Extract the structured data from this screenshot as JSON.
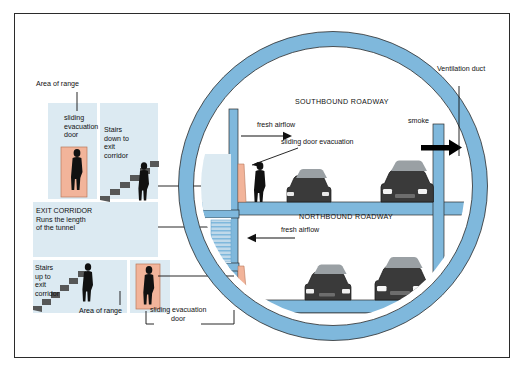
{
  "diagram": {
    "colors": {
      "ring_blue": "#7FB8DC",
      "ring_blue_dark": "#5E9FC8",
      "tile_pale": "#DCEAF2",
      "door_salmon": "#F2B49A",
      "stair_gray": "#4A4A4A",
      "car_dark": "#3A3A3A",
      "frame": "#2b2b2b",
      "smoke_arrow": "#000000"
    },
    "left_panel": {
      "top_callout": "Area of range",
      "bottom_callout": "Area of range",
      "tiles": [
        {
          "name": "sliding-evacuation-door-tile",
          "text": "sliding\nevacuation\ndoor"
        },
        {
          "name": "stairs-down-tile",
          "text": "Stairs\ndown to\nexit\ncorridor"
        },
        {
          "name": "exit-corridor-tile",
          "text": "EXIT CORRIDOR\nRuns the length\nof the tunnel"
        },
        {
          "name": "stairs-up-tile",
          "text": "Stairs\nup to\nexit\ncorridor"
        }
      ],
      "bottom_door_label": "sliding evacuation\ndoor"
    },
    "tunnel": {
      "upper_deck_label": "SOUTHBOUND ROADWAY",
      "lower_deck_label": "NORTHBOUND ROADWAY",
      "annotations": {
        "fresh_airflow_upper": "fresh airflow",
        "sliding_door_evacuation": "sliding door evacuation",
        "smoke": "smoke",
        "ventilation_duct": "Ventilation duct",
        "fresh_airflow_lower": "fresh airflow"
      }
    }
  }
}
